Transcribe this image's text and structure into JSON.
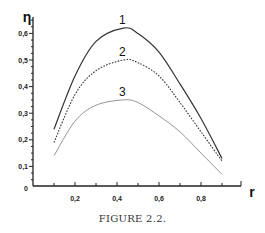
{
  "chart_data": {
    "type": "line",
    "title": "",
    "xlabel": "r",
    "ylabel": "η",
    "xlim": [
      0,
      0.98
    ],
    "ylim": [
      0,
      0.68
    ],
    "xticks": [
      0.2,
      0.4,
      0.6,
      0.8
    ],
    "xtick_labels": [
      "0,2",
      "0,4",
      "0,6",
      "0,8"
    ],
    "yticks": [
      0.1,
      0.2,
      0.3,
      0.4,
      0.5,
      0.6
    ],
    "ytick_labels": [
      "0,1",
      "0,2",
      "0,3",
      "0,4",
      "0,5",
      "0,6"
    ],
    "origin_label": "0",
    "grid": false,
    "legend": "inline curve numbers",
    "x": [
      0.1,
      0.2,
      0.3,
      0.43,
      0.5,
      0.6,
      0.7,
      0.8,
      0.9
    ],
    "series": [
      {
        "name": "1",
        "style": "solid",
        "color": "#333333",
        "values": [
          0.24,
          0.44,
          0.57,
          0.62,
          0.6,
          0.53,
          0.41,
          0.28,
          0.13
        ]
      },
      {
        "name": "2",
        "style": "dotted",
        "color": "#333333",
        "values": [
          0.19,
          0.37,
          0.46,
          0.5,
          0.49,
          0.44,
          0.34,
          0.23,
          0.12
        ]
      },
      {
        "name": "3",
        "style": "thin-solid",
        "color": "#888888",
        "values": [
          0.14,
          0.27,
          0.33,
          0.35,
          0.34,
          0.29,
          0.23,
          0.15,
          0.07
        ]
      }
    ]
  },
  "caption": "FIGURE 2.2."
}
